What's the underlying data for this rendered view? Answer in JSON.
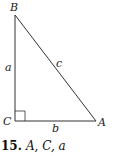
{
  "diagram": {
    "type": "right-triangle",
    "vertices": [
      {
        "name": "B",
        "position": "top"
      },
      {
        "name": "C",
        "position": "bottom-left",
        "right_angle": true
      },
      {
        "name": "A",
        "position": "bottom-right"
      }
    ],
    "sides": [
      {
        "name": "a",
        "between": "B-C"
      },
      {
        "name": "b",
        "between": "C-A"
      },
      {
        "name": "c",
        "between": "B-A"
      }
    ],
    "labels": {
      "B": "B",
      "C": "C",
      "A": "A",
      "a": "a",
      "b": "b",
      "c": "c"
    },
    "line_color": "#333333"
  },
  "caption": {
    "number": "15.",
    "text": "A, C, a"
  }
}
